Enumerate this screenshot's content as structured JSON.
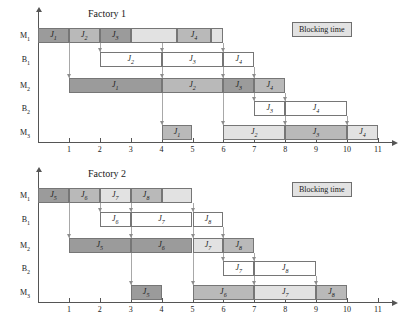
{
  "legend": {
    "label": "Blocking time",
    "fill": "#e2e2e2"
  },
  "colors": {
    "dark": "#9b9b9b",
    "medium": "#b9b9b9",
    "light": "#e2e2e2",
    "white": "#ffffff",
    "axis": "#555555",
    "connector": "#a8a8a8"
  },
  "chart_data": {
    "type": "bar",
    "xlabel": "",
    "ylabel": "",
    "charts": [
      {
        "title": "Factory 1",
        "xlim": [
          0,
          11
        ],
        "xticks": [
          1,
          2,
          3,
          4,
          5,
          6,
          7,
          8,
          9,
          10,
          11
        ],
        "rows": [
          "M1",
          "B1",
          "M2",
          "B2",
          "M3"
        ],
        "row_labels": [
          "M",
          "B",
          "M",
          "B",
          "M"
        ],
        "row_subs": [
          "1",
          "1",
          "2",
          "2",
          "3"
        ],
        "bars": [
          {
            "row": 0,
            "start": 0,
            "end": 1,
            "label": "J",
            "sub": "1",
            "shade": "dark"
          },
          {
            "row": 0,
            "start": 1,
            "end": 2,
            "label": "J",
            "sub": "2",
            "shade": "medium"
          },
          {
            "row": 0,
            "start": 2,
            "end": 3,
            "label": "J",
            "sub": "3",
            "shade": "dark"
          },
          {
            "row": 0,
            "start": 3,
            "end": 4.5,
            "label": "",
            "sub": "",
            "shade": "light"
          },
          {
            "row": 0,
            "start": 4.5,
            "end": 5.6,
            "label": "J",
            "sub": "4",
            "shade": "medium"
          },
          {
            "row": 0,
            "start": 5.6,
            "end": 6,
            "label": "",
            "sub": "",
            "shade": "light"
          },
          {
            "row": 1,
            "start": 2,
            "end": 4,
            "label": "J",
            "sub": "2",
            "shade": "white"
          },
          {
            "row": 1,
            "start": 4,
            "end": 6,
            "label": "J",
            "sub": "3",
            "shade": "white"
          },
          {
            "row": 1,
            "start": 6,
            "end": 7,
            "label": "J",
            "sub": "4",
            "shade": "white"
          },
          {
            "row": 2,
            "start": 1,
            "end": 4,
            "label": "J",
            "sub": "1",
            "shade": "dark"
          },
          {
            "row": 2,
            "start": 4,
            "end": 6,
            "label": "J",
            "sub": "2",
            "shade": "medium"
          },
          {
            "row": 2,
            "start": 6,
            "end": 7,
            "label": "J",
            "sub": "3",
            "shade": "dark"
          },
          {
            "row": 2,
            "start": 7,
            "end": 8,
            "label": "J",
            "sub": "4",
            "shade": "medium"
          },
          {
            "row": 3,
            "start": 7,
            "end": 8,
            "label": "J",
            "sub": "3",
            "shade": "white"
          },
          {
            "row": 3,
            "start": 8,
            "end": 10,
            "label": "J",
            "sub": "4",
            "shade": "white"
          },
          {
            "row": 4,
            "start": 4,
            "end": 5,
            "label": "J",
            "sub": "1",
            "shade": "medium"
          },
          {
            "row": 4,
            "start": 6,
            "end": 8,
            "label": "J",
            "sub": "2",
            "shade": "light"
          },
          {
            "row": 4,
            "start": 8,
            "end": 10,
            "label": "J",
            "sub": "3",
            "shade": "medium"
          },
          {
            "row": 4,
            "start": 10,
            "end": 11,
            "label": "J",
            "sub": "4",
            "shade": "light"
          }
        ],
        "connectors": [
          {
            "x": 1,
            "from": 0,
            "to": 2
          },
          {
            "x": 2,
            "from": 0,
            "to": 1
          },
          {
            "x": 4,
            "from": 0,
            "to": 1
          },
          {
            "x": 6,
            "from": 0,
            "to": 1
          },
          {
            "x": 4,
            "from": 1,
            "to": 2
          },
          {
            "x": 6,
            "from": 1,
            "to": 2
          },
          {
            "x": 7,
            "from": 1,
            "to": 2
          },
          {
            "x": 4,
            "from": 2,
            "to": 4
          },
          {
            "x": 6,
            "from": 2,
            "to": 4
          },
          {
            "x": 7,
            "from": 2,
            "to": 3
          },
          {
            "x": 8,
            "from": 2,
            "to": 3
          },
          {
            "x": 8,
            "from": 3,
            "to": 4
          },
          {
            "x": 10,
            "from": 3,
            "to": 4
          }
        ]
      },
      {
        "title": "Factory 2",
        "xlim": [
          0,
          11
        ],
        "xticks": [
          1,
          2,
          3,
          4,
          5,
          6,
          7,
          8,
          9,
          10,
          11
        ],
        "rows": [
          "M1",
          "B1",
          "M2",
          "B2",
          "M3"
        ],
        "row_labels": [
          "M",
          "B",
          "M",
          "B",
          "M"
        ],
        "row_subs": [
          "1",
          "1",
          "2",
          "2",
          "3"
        ],
        "bars": [
          {
            "row": 0,
            "start": 0,
            "end": 1,
            "label": "J",
            "sub": "5",
            "shade": "dark"
          },
          {
            "row": 0,
            "start": 1,
            "end": 2,
            "label": "J",
            "sub": "6",
            "shade": "medium"
          },
          {
            "row": 0,
            "start": 2,
            "end": 3,
            "label": "J",
            "sub": "7",
            "shade": "light"
          },
          {
            "row": 0,
            "start": 3,
            "end": 4,
            "label": "J",
            "sub": "8",
            "shade": "medium"
          },
          {
            "row": 0,
            "start": 4,
            "end": 5,
            "label": "",
            "sub": "",
            "shade": "light"
          },
          {
            "row": 1,
            "start": 2,
            "end": 3,
            "label": "J",
            "sub": "6",
            "shade": "white"
          },
          {
            "row": 1,
            "start": 3,
            "end": 5,
            "label": "J",
            "sub": "7",
            "shade": "white"
          },
          {
            "row": 1,
            "start": 5,
            "end": 6,
            "label": "J",
            "sub": "8",
            "shade": "white"
          },
          {
            "row": 2,
            "start": 1,
            "end": 3,
            "label": "J",
            "sub": "5",
            "shade": "dark"
          },
          {
            "row": 2,
            "start": 3,
            "end": 5,
            "label": "J",
            "sub": "6",
            "shade": "dark"
          },
          {
            "row": 2,
            "start": 5,
            "end": 6,
            "label": "J",
            "sub": "7",
            "shade": "light"
          },
          {
            "row": 2,
            "start": 6,
            "end": 7,
            "label": "J",
            "sub": "8",
            "shade": "medium"
          },
          {
            "row": 3,
            "start": 6,
            "end": 7,
            "label": "J",
            "sub": "7",
            "shade": "white"
          },
          {
            "row": 3,
            "start": 7,
            "end": 9,
            "label": "J",
            "sub": "8",
            "shade": "white"
          },
          {
            "row": 4,
            "start": 3,
            "end": 4,
            "label": "J",
            "sub": "5",
            "shade": "dark"
          },
          {
            "row": 4,
            "start": 5,
            "end": 7,
            "label": "J",
            "sub": "6",
            "shade": "medium"
          },
          {
            "row": 4,
            "start": 7,
            "end": 9,
            "label": "J",
            "sub": "7",
            "shade": "light"
          },
          {
            "row": 4,
            "start": 9,
            "end": 10,
            "label": "J",
            "sub": "8",
            "shade": "medium"
          }
        ],
        "connectors": [
          {
            "x": 1,
            "from": 0,
            "to": 2
          },
          {
            "x": 2,
            "from": 0,
            "to": 1
          },
          {
            "x": 3,
            "from": 0,
            "to": 1
          },
          {
            "x": 5,
            "from": 0,
            "to": 1
          },
          {
            "x": 3,
            "from": 1,
            "to": 2
          },
          {
            "x": 5,
            "from": 1,
            "to": 2
          },
          {
            "x": 6,
            "from": 1,
            "to": 2
          },
          {
            "x": 3,
            "from": 2,
            "to": 4
          },
          {
            "x": 5,
            "from": 2,
            "to": 4
          },
          {
            "x": 6,
            "from": 2,
            "to": 3
          },
          {
            "x": 7,
            "from": 2,
            "to": 3
          },
          {
            "x": 7,
            "from": 3,
            "to": 4
          },
          {
            "x": 9,
            "from": 3,
            "to": 4
          }
        ]
      }
    ]
  }
}
